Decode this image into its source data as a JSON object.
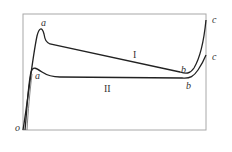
{
  "diagram": {
    "type": "stress-strain-style curves",
    "origin_label": "o",
    "curves": [
      {
        "name": "I",
        "points": {
          "peak": "a",
          "min": "b",
          "end": "c"
        }
      },
      {
        "name": "II",
        "points": {
          "peak": "a",
          "min": "b",
          "end": "c"
        }
      }
    ],
    "colors": {
      "frame": "#a0a0a0",
      "curve": "#222222",
      "text": "#333333"
    }
  }
}
